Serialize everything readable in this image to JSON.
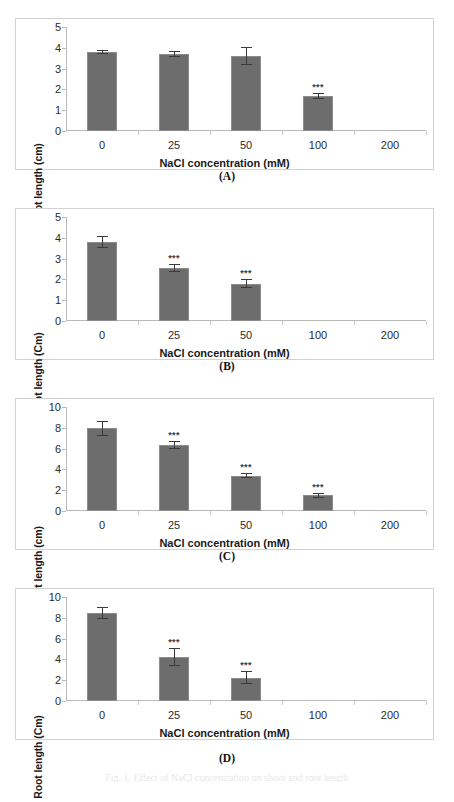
{
  "figure": {
    "panel_letters": [
      "(A)",
      "(B)",
      "(C)",
      "(D)"
    ],
    "bar_color": "#6d6d6d",
    "bar_edge_color": "#8c8c8c",
    "error_color": "#3a3a3a",
    "axis_color": "#b9b9b9",
    "panel_border_color": "#d2d2d2",
    "significance_marker": "***",
    "bottom_partial_caption": "Fig. 1. Effect of NaCl concentration on shoot and root length"
  },
  "chart_data": [
    {
      "type": "bar",
      "panel": "(A)",
      "title": "",
      "xlabel": "NaCl concentration (mM)",
      "ylabel": "Shoot length (cm)",
      "categories": [
        "0",
        "25",
        "50",
        "100",
        "200"
      ],
      "values": [
        3.8,
        3.7,
        3.6,
        1.7,
        null
      ],
      "errors": [
        0.08,
        0.15,
        0.45,
        0.15,
        null
      ],
      "significance": [
        "",
        "",
        "",
        "***",
        ""
      ],
      "ylim": [
        0,
        5
      ],
      "yticks": [
        "0",
        "1",
        "2",
        "3",
        "4",
        "5"
      ],
      "grid": false,
      "legend": "none"
    },
    {
      "type": "bar",
      "panel": "(B)",
      "title": "",
      "xlabel": "NaCl concentration (mM)",
      "ylabel": "Shoot length (Cm)",
      "categories": [
        "0",
        "25",
        "50",
        "100",
        "200"
      ],
      "values": [
        3.8,
        2.55,
        1.8,
        null,
        null
      ],
      "errors": [
        0.28,
        0.18,
        0.2,
        null,
        null
      ],
      "significance": [
        "",
        "***",
        "***",
        "",
        ""
      ],
      "ylim": [
        0,
        5
      ],
      "yticks": [
        "0",
        "1",
        "2",
        "3",
        "4",
        "5"
      ],
      "grid": false,
      "legend": "none"
    },
    {
      "type": "bar",
      "panel": "(C)",
      "title": "",
      "xlabel": "NaCl concentration (mM)",
      "ylabel": "Root length (cm)",
      "categories": [
        "0",
        "25",
        "50",
        "100",
        "200"
      ],
      "values": [
        7.95,
        6.35,
        3.4,
        1.5,
        null
      ],
      "errors": [
        0.7,
        0.35,
        0.25,
        0.22,
        null
      ],
      "significance": [
        "",
        "***",
        "***",
        "***",
        ""
      ],
      "ylim": [
        0,
        10
      ],
      "yticks": [
        "0",
        "2",
        "4",
        "6",
        "8",
        "10"
      ],
      "grid": false,
      "legend": "none"
    },
    {
      "type": "bar",
      "panel": "(D)",
      "title": "",
      "xlabel": "NaCl concentration (mM)",
      "ylabel": "Root length (Cm)",
      "categories": [
        "0",
        "25",
        "50",
        "100",
        "200"
      ],
      "values": [
        8.45,
        4.2,
        2.25,
        null,
        null
      ],
      "errors": [
        0.6,
        0.85,
        0.6,
        null,
        null
      ],
      "significance": [
        "",
        "***",
        "***",
        "",
        ""
      ],
      "ylim": [
        0,
        10
      ],
      "yticks": [
        "0",
        "2",
        "4",
        "6",
        "8",
        "10"
      ],
      "grid": false,
      "legend": "none"
    }
  ]
}
